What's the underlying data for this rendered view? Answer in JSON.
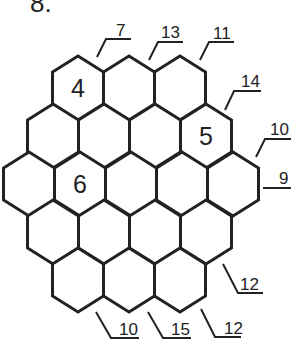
{
  "puzzle": {
    "number_label": "8.",
    "colors": {
      "line": "#222222",
      "background": "#ffffff"
    },
    "rows": [
      {
        "cells": [
          "4",
          "",
          ""
        ]
      },
      {
        "cells": [
          "",
          "",
          "",
          "5"
        ]
      },
      {
        "cells": [
          "",
          "6",
          "",
          "",
          ""
        ]
      },
      {
        "cells": [
          "",
          "",
          "",
          ""
        ]
      },
      {
        "cells": [
          "",
          "",
          ""
        ]
      }
    ],
    "clues": [
      {
        "id": "top-1",
        "value": "7"
      },
      {
        "id": "top-2",
        "value": "13"
      },
      {
        "id": "top-3",
        "value": "11"
      },
      {
        "id": "right-1",
        "value": "14"
      },
      {
        "id": "right-2",
        "value": "10"
      },
      {
        "id": "right-3",
        "value": "9"
      },
      {
        "id": "bottom-right-1",
        "value": "12"
      },
      {
        "id": "bottom-right-2",
        "value": "12"
      },
      {
        "id": "bottom-2",
        "value": "15"
      },
      {
        "id": "bottom-1",
        "value": "10"
      }
    ]
  }
}
